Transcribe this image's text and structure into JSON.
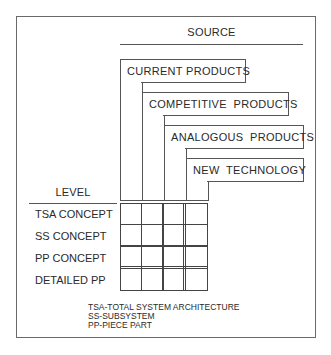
{
  "diagram": {
    "source_heading": "SOURCE",
    "level_heading": "LEVEL",
    "sources": [
      {
        "label": "CURRENT PRODUCTS"
      },
      {
        "label": "COMPETITIVE  PRODUCTS"
      },
      {
        "label": "ANALOGOUS  PRODUCTS"
      },
      {
        "label": "NEW  TECHNOLOGY"
      }
    ],
    "levels": [
      {
        "label": "TSA CONCEPT"
      },
      {
        "label": "SS CONCEPT"
      },
      {
        "label": "PP CONCEPT"
      },
      {
        "label": "DETAILED PP"
      }
    ],
    "legend": [
      "TSA-TOTAL SYSTEM ARCHITECTURE",
      "SS-SUBSYSTEM",
      "PP-PIECE PART"
    ],
    "grid": {
      "rows": 4,
      "cols": 4
    }
  }
}
